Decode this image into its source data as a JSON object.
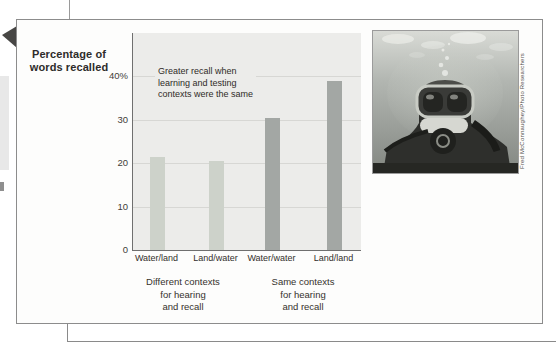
{
  "figure": {
    "y_axis_title_lines": [
      "Percentage of",
      "words recalled"
    ],
    "group_labels": [
      {
        "lines": [
          "Different contexts",
          "for hearing",
          "and recall"
        ]
      },
      {
        "lines": [
          "Same contexts",
          "for hearing",
          "and recall"
        ]
      }
    ]
  },
  "chart_data": {
    "type": "bar",
    "categories": [
      "Water/land",
      "Land/water",
      "Water/water",
      "Land/land"
    ],
    "values": [
      21.5,
      20.5,
      30.5,
      39
    ],
    "bar_colors": [
      "#cdd2ca",
      "#cdd2ca",
      "#a3a7a4",
      "#a3a7a4"
    ],
    "title": "",
    "xlabel": "",
    "ylabel": "Percentage of words recalled",
    "ylim": [
      0,
      50
    ],
    "grid": true,
    "yticks": [
      {
        "value": 0,
        "label": "0"
      },
      {
        "value": 10,
        "label": "10"
      },
      {
        "value": 20,
        "label": "20"
      },
      {
        "value": 30,
        "label": "30"
      },
      {
        "value": 40,
        "label": "40%"
      }
    ],
    "annotation_lines": [
      "Greater recall when",
      "learning and testing",
      "contexts were the same"
    ],
    "groups": [
      {
        "label": "Different contexts for hearing and recall",
        "categories": [
          "Water/land",
          "Land/water"
        ]
      },
      {
        "label": "Same contexts for hearing and recall",
        "categories": [
          "Water/water",
          "Land/land"
        ]
      }
    ]
  },
  "photo": {
    "credit": "Fred McConnaughey/Photo Researchers"
  },
  "colors": {
    "light_bar": "#cdd2ca",
    "dark_bar": "#a3a7a4",
    "plot_background": "#ececea",
    "gridline": "#d7d7d4",
    "axis_line": "#6f6f6f",
    "panel_border": "#8c8c8c",
    "text_dark": "#2e2c2a"
  }
}
